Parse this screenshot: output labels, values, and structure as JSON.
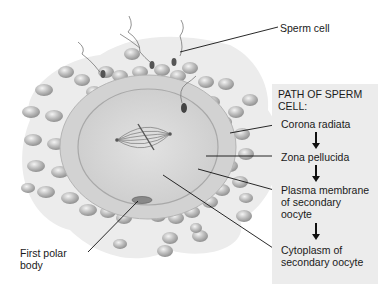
{
  "diagram": {
    "labels": {
      "sperm_cell": "Sperm cell",
      "first_polar_body": [
        "First polar",
        "body"
      ]
    },
    "path_box": {
      "title": [
        "PATH OF SPERM",
        "CELL:"
      ],
      "steps": [
        {
          "lines": [
            "Corona radiata"
          ]
        },
        {
          "lines": [
            "Zona pellucida"
          ]
        },
        {
          "lines": [
            "Plasma membrane",
            "of secondary",
            "oocyte"
          ]
        },
        {
          "lines": [
            "Cytoplasm of",
            "secondary oocyte"
          ]
        }
      ]
    },
    "colors": {
      "background": "#ffffff",
      "box": "#ececec",
      "cumulus": "#e4e4e4",
      "zona": "#cfcfcf",
      "cytoplasm": "#d9d9d9",
      "granulosa_cell": "#b8b8b8",
      "leader_line": "#111111"
    }
  }
}
